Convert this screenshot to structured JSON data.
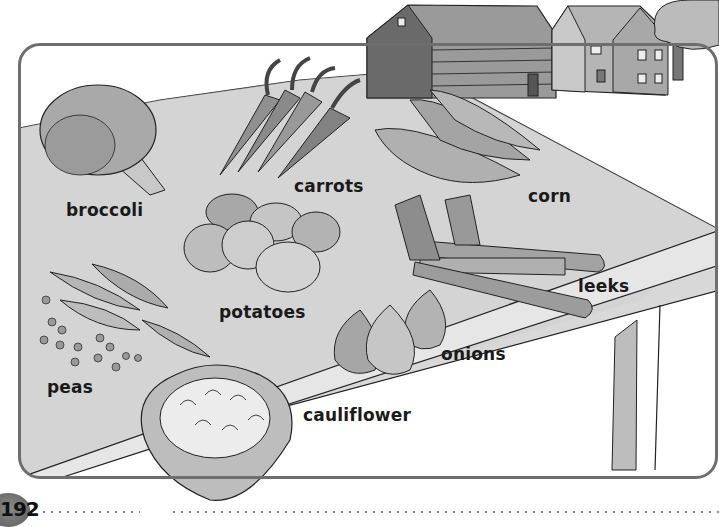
{
  "page": {
    "number": "192"
  },
  "illustration": {
    "subject": "vegetables on a table with farm buildings in background",
    "labels": {
      "broccoli": "broccoli",
      "carrots": "carrots",
      "corn": "corn",
      "potatoes": "potatoes",
      "leeks": "leeks",
      "peas": "peas",
      "onions": "onions",
      "cauliflower": "cauliflower"
    }
  },
  "colors": {
    "frame_border": "#6e6e6e",
    "table_top": "#d9d9d9",
    "label_text": "#1a1a1a",
    "page_badge": "#777777",
    "dots": "#8a8a8a"
  }
}
